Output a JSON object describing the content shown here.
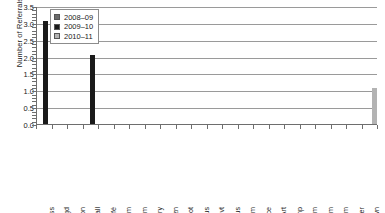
{
  "chart_data": {
    "type": "bar",
    "title": "",
    "xlabel": "",
    "ylabel": "Number of Referrals",
    "ylim": [
      0,
      3.5
    ],
    "ytick_labels": [
      "0.0",
      "0.5",
      "1.0",
      "1.5",
      "2.0",
      "2.5",
      "3.0",
      "3.5"
    ],
    "ytick_values": [
      0,
      0.5,
      1,
      1.5,
      2,
      2.5,
      3,
      3.5
    ],
    "grid": true,
    "legend_position": "upper-left-inside",
    "categories": [
      "Class",
      "Plygd",
      "Common",
      "Hall",
      "Café",
      "Bathrm",
      "Gym",
      "Library",
      "Bus zn",
      "Park lot",
      "Bus",
      "Special evt",
      "Off-Campus",
      "Stadium",
      "Office",
      "Art",
      "Comp",
      "Locker rm",
      "Music rm",
      "Voc Rm",
      "Other",
      "Unknown"
    ],
    "series": [
      {
        "name": "2008–09",
        "color": "#6b6b6b",
        "values": [
          0,
          0,
          0,
          0,
          0,
          0,
          0,
          0,
          0,
          0,
          0,
          0,
          0,
          0,
          0,
          0,
          0,
          0,
          0,
          0,
          0,
          0
        ]
      },
      {
        "name": "2009–10",
        "color": "#1a1a1a",
        "values": [
          3,
          0,
          0,
          2,
          0,
          0,
          0,
          0,
          0,
          0,
          0,
          0,
          0,
          0,
          0,
          0,
          0,
          0,
          0,
          0,
          0,
          0
        ]
      },
      {
        "name": "2010–11",
        "color": "#b3b3b3",
        "values": [
          0,
          0,
          0,
          0,
          0,
          0,
          0,
          0,
          0,
          0,
          0,
          0,
          0,
          0,
          0,
          0,
          0,
          0,
          0,
          0,
          0,
          1
        ]
      }
    ]
  },
  "legend": {
    "items": [
      {
        "label": "2008–09",
        "color": "#6b6b6b"
      },
      {
        "label": "2009–10",
        "color": "#1a1a1a"
      },
      {
        "label": "2010–11",
        "color": "#b3b3b3"
      }
    ]
  },
  "axis": {
    "y_title": "Number of Referrals"
  },
  "colors": {
    "grid": "#9a9a9a",
    "axis": "#6e6e6e",
    "text": "#1a1a1a",
    "background": "#ffffff"
  }
}
